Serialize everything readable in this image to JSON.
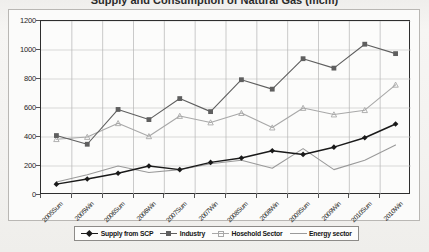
{
  "title": "Supply and Consumption of Natural Gas (mcm)",
  "chart_data": {
    "type": "line",
    "title": "Supply and Consumption of Natural Gas (mcm)",
    "xlabel": "",
    "ylabel": "",
    "ylim": [
      0,
      1200
    ],
    "ytick_step": 200,
    "ytick_labels": [
      "0",
      "200",
      "400",
      "600",
      "800",
      "1000",
      "1200"
    ],
    "grid": true,
    "legend_position": "bottom",
    "categories": [
      "2005Sum",
      "2005Win",
      "2006Sum",
      "2006Win",
      "2007Sum",
      "2007Win",
      "2008Sum",
      "2008Win",
      "2009Sum",
      "2009Win",
      "2010Sum",
      "2010Win"
    ],
    "series": [
      {
        "name": "Supply from SCP",
        "color": "#1a1a1a",
        "marker": "diamond",
        "values": [
          75,
          110,
          150,
          200,
          175,
          225,
          255,
          305,
          280,
          330,
          395,
          490
        ]
      },
      {
        "name": "Industry",
        "color": "#5f5f5f",
        "marker": "square",
        "values": [
          410,
          350,
          590,
          520,
          665,
          575,
          795,
          730,
          940,
          875,
          1040,
          975
        ]
      },
      {
        "name": "Hosehold Sector",
        "color": "#a8a8a8",
        "marker": "triangle",
        "values": [
          385,
          400,
          495,
          405,
          545,
          500,
          565,
          465,
          600,
          555,
          585,
          760
        ]
      },
      {
        "name": "Energy sector",
        "color": "#9a9a9a",
        "marker": "none",
        "values": [
          90,
          140,
          200,
          155,
          175,
          215,
          240,
          185,
          320,
          175,
          240,
          345
        ]
      }
    ]
  },
  "legend": {
    "items": [
      {
        "label": "Supply from SCP",
        "color": "#1a1a1a",
        "marker": "diamond"
      },
      {
        "label": "Industry",
        "color": "#5f5f5f",
        "marker": "square"
      },
      {
        "label": "Hosehold Sector",
        "color": "#a8a8a8",
        "marker": "triangle"
      },
      {
        "label": "Energy sector",
        "color": "#9a9a9a",
        "marker": "none"
      }
    ]
  }
}
